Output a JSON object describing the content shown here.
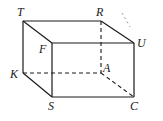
{
  "diagram": {
    "type": "cuboid",
    "colors": {
      "line": "#1a1a1a",
      "background": "#ffffff"
    },
    "vertices": {
      "T": {
        "x": 23,
        "y": 21
      },
      "R": {
        "x": 101,
        "y": 21
      },
      "F": {
        "x": 52,
        "y": 43
      },
      "U": {
        "x": 134,
        "y": 43
      },
      "K": {
        "x": 23,
        "y": 73
      },
      "A": {
        "x": 101,
        "y": 73
      },
      "S": {
        "x": 52,
        "y": 97
      },
      "C": {
        "x": 134,
        "y": 97
      }
    },
    "labels": {
      "T": "T",
      "R": "R",
      "F": "F",
      "U": "U",
      "K": "K",
      "A": "A",
      "S": "S",
      "C": "C"
    },
    "solid_edges": [
      "TR",
      "TF",
      "RU",
      "FU",
      "TK",
      "FS",
      "UC",
      "KS",
      "SC"
    ],
    "dashed_edges": [
      "RA",
      "KA",
      "AC"
    ]
  }
}
